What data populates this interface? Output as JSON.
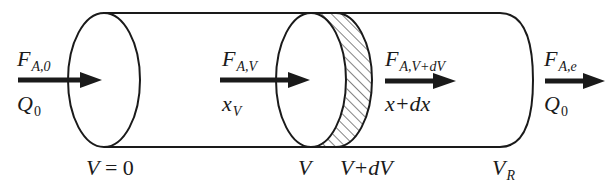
{
  "diagram": {
    "colors": {
      "stroke": "#1a1a1a",
      "background": "#ffffff"
    },
    "inlet": {
      "flow_symbol": "F",
      "flow_subscript": "A,0",
      "rate_symbol": "Q",
      "rate_subscript": "0",
      "position_label_main": "V",
      "position_label_rest": " = 0"
    },
    "element_in": {
      "flow_symbol": "F",
      "flow_subscript": "A,V",
      "conv_symbol": "x",
      "conv_subscript": "V",
      "position_label": "V"
    },
    "element_out": {
      "flow_symbol": "F",
      "flow_subscript": "A,V+dV",
      "conv_label": "x+dx",
      "position_label": "V+dV"
    },
    "outlet": {
      "flow_symbol": "F",
      "flow_subscript": "A,e",
      "rate_symbol": "Q",
      "rate_subscript": "0",
      "position_symbol": "V",
      "position_subscript": "R"
    }
  }
}
